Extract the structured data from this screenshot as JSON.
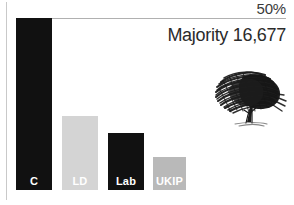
{
  "chart_data": {
    "type": "bar",
    "title": "",
    "subtitle": "",
    "xlabel": "",
    "ylabel": "",
    "ylim": [
      0,
      57.5
    ],
    "grid": false,
    "legend": "none",
    "gridlines": [
      {
        "value": 50,
        "label": "50%"
      }
    ],
    "categories": [
      "C",
      "LD",
      "Lab",
      "UKIP"
    ],
    "values": [
      50.0,
      21.5,
      16.5,
      9.5
    ],
    "colors": [
      "#111111",
      "#d4d4d4",
      "#111111",
      "#b9b9b9"
    ],
    "label_colors": [
      "#ffffff",
      "#ffffff",
      "#ffffff",
      "#ffffff"
    ],
    "annotations": [
      {
        "name": "majority",
        "text": "Majority 16,677"
      }
    ]
  },
  "axis": {
    "tick_50_label": "50%"
  },
  "annotations": {
    "majority_text": "Majority 16,677"
  },
  "bars": [
    {
      "key": "conservative",
      "label": "C",
      "value": 50.0,
      "color": "#111111",
      "label_color": "#ffffff",
      "left": 16,
      "width": 36
    },
    {
      "key": "liberal-democrat",
      "label": "LD",
      "value": 21.5,
      "color": "#d4d4d4",
      "label_color": "#ffffff",
      "left": 62,
      "width": 36
    },
    {
      "key": "labour",
      "label": "Lab",
      "value": 16.5,
      "color": "#111111",
      "label_color": "#ffffff",
      "left": 108,
      "width": 36
    },
    {
      "key": "ukip",
      "label": "UKIP",
      "value": 9.5,
      "color": "#b9b9b9",
      "label_color": "#ffffff",
      "left": 153,
      "width": 33
    }
  ],
  "logo": {
    "name": "conservative-oak-tree-logo",
    "color": "#1a1a1a"
  },
  "colors": {
    "background": "#ffffff",
    "axis_line": "#c9c9c9",
    "reference_line": "#b0b0b0",
    "text": "#2b2b2b"
  }
}
